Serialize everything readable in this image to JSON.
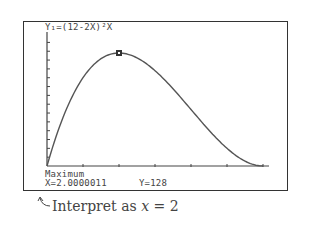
{
  "screen": {
    "equation": "Y₁=(12-2X)²X",
    "status_label": "Maximum",
    "x_readout": "X=2.0000011",
    "y_readout": "Y=128"
  },
  "caption": {
    "text_prefix": "Interpret as ",
    "variable": "x",
    "text_suffix": " = 2"
  },
  "chart_data": {
    "type": "line",
    "function": "(12-2x)^2 * x",
    "xlabel": "",
    "ylabel": "",
    "xlim": [
      0,
      6.5
    ],
    "ylim": [
      0,
      140
    ],
    "x_tick_step": 1,
    "y_tick_step": 10,
    "grid": false,
    "x": [
      0,
      0.5,
      1,
      1.5,
      2,
      2.5,
      3,
      3.5,
      4,
      4.5,
      5,
      5.5,
      6
    ],
    "values": [
      0,
      60.5,
      100,
      121.5,
      128,
      122.5,
      108,
      87.5,
      64,
      40.5,
      20,
      5.5,
      0
    ],
    "annotations": [
      {
        "type": "marker",
        "x": 2,
        "y": 128,
        "label": "Maximum"
      },
      {
        "type": "readout",
        "text": "X=2.0000011  Y=128"
      },
      {
        "type": "caption",
        "text": "Interpret as x = 2"
      }
    ]
  }
}
